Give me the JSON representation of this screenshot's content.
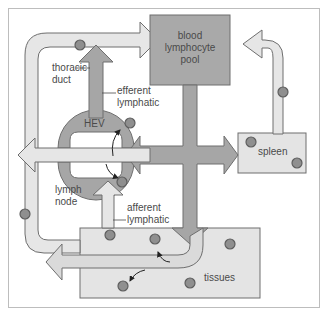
{
  "diagram": {
    "type": "lymphocyte recirculation",
    "nodes": {
      "blood_pool": {
        "label": "blood\nlymphocyte\npool",
        "lines": [
          "blood",
          "lymphocyte",
          "pool"
        ]
      },
      "spleen": {
        "label": "spleen"
      },
      "tissues": {
        "label": "tissues"
      },
      "lymph_node": {
        "label": "lymph\nnode",
        "lines": [
          "lymph",
          "node"
        ]
      },
      "hev": {
        "label": "HEV"
      }
    },
    "callouts": {
      "thoracic_duct": {
        "lines": [
          "thoracic",
          "duct"
        ]
      },
      "efferent_lymphatic": {
        "lines": [
          "efferent",
          "lymphatic"
        ]
      },
      "afferent_lymphatic": {
        "lines": [
          "afferent",
          "lymphatic"
        ]
      }
    },
    "colors": {
      "light_fill": "#e6e6e6",
      "dark_fill": "#a6a6a6",
      "outline": "#6e6e6e",
      "box_fill": "#a9a9a9",
      "pale_box": "#e4e4e4",
      "cell_fill": "#8f8f8f",
      "text": "#4a4a4a"
    }
  }
}
